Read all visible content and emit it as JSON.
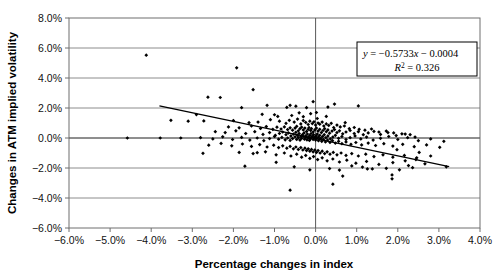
{
  "chart_data": {
    "type": "scatter",
    "title": "",
    "xlabel": "Percentage changes in index",
    "ylabel": "Changes in ATM implied volatility",
    "xlim": [
      -6.0,
      4.0
    ],
    "ylim": [
      -6.0,
      8.0
    ],
    "xtick_labels": [
      "-6.0%",
      "-5.0%",
      "-4.0%",
      "-3.0%",
      "-2.0%",
      "-1.0%",
      "0.0%",
      "1.0%",
      "2.0%",
      "3.0%",
      "4.0%"
    ],
    "xtick_values": [
      -6.0,
      -5.0,
      -4.0,
      -3.0,
      -2.0,
      -1.0,
      0.0,
      1.0,
      2.0,
      3.0,
      4.0
    ],
    "ytick_labels": [
      "-6.0%",
      "-4.0%",
      "-2.0%",
      "0.0%",
      "2.0%",
      "4.0%",
      "6.0%",
      "8.0%"
    ],
    "ytick_values": [
      -6.0,
      -4.0,
      -2.0,
      0.0,
      2.0,
      4.0,
      6.0,
      8.0
    ],
    "grid": "horizontal",
    "legend_position": "none",
    "marker": "diamond",
    "marker_color": "#000000",
    "annotation": {
      "equation": "y = −0.5733x − 0.0004",
      "equation_y": "y",
      "equation_rest": " = −0.5733",
      "equation_x": "x",
      "equation_tail": " − 0.0004",
      "r_squared_label": "R",
      "r_squared_exp": "2",
      "r_squared_value": " = 0.326",
      "box_border_color": "#000000"
    },
    "trendline": {
      "slope": -0.5733,
      "intercept": -0.0004,
      "x_start": -3.8,
      "x_end": 3.25,
      "color": "#000000"
    },
    "points": [
      [
        -4.12,
        5.52
      ],
      [
        -1.92,
        4.68
      ],
      [
        -1.52,
        3.22
      ],
      [
        -2.62,
        2.72
      ],
      [
        -2.32,
        2.7
      ],
      [
        -1.18,
        2.18
      ],
      [
        -1.8,
        2.02
      ],
      [
        -0.62,
        2.18
      ],
      [
        -0.48,
        2.12
      ],
      [
        -0.7,
        2.04
      ],
      [
        -0.22,
        2.02
      ],
      [
        0.3,
        2.06
      ],
      [
        -2.9,
        1.56
      ],
      [
        -1.3,
        1.58
      ],
      [
        -1.0,
        1.55
      ],
      [
        -0.92,
        1.44
      ],
      [
        -0.58,
        1.5
      ],
      [
        -0.4,
        1.68
      ],
      [
        -0.3,
        1.42
      ],
      [
        -0.12,
        1.62
      ],
      [
        0.04,
        1.3
      ],
      [
        0.26,
        1.44
      ],
      [
        0.02,
        1.7
      ],
      [
        0.72,
        1.02
      ],
      [
        -3.52,
        1.18
      ],
      [
        -3.1,
        1.12
      ],
      [
        -2.72,
        1.14
      ],
      [
        -2.0,
        1.16
      ],
      [
        -1.62,
        1.02
      ],
      [
        -1.4,
        1.06
      ],
      [
        -1.1,
        1.22
      ],
      [
        -0.88,
        1.12
      ],
      [
        -0.72,
        0.98
      ],
      [
        -0.64,
        1.18
      ],
      [
        -0.52,
        1.06
      ],
      [
        -0.44,
        1.26
      ],
      [
        -0.36,
        0.94
      ],
      [
        -0.3,
        1.16
      ],
      [
        -0.24,
        1.04
      ],
      [
        -0.18,
        0.9
      ],
      [
        -0.14,
        1.12
      ],
      [
        -0.08,
        0.96
      ],
      [
        -0.04,
        1.08
      ],
      [
        0.0,
        0.86
      ],
      [
        0.06,
        1.0
      ],
      [
        0.1,
        0.92
      ],
      [
        0.16,
        1.06
      ],
      [
        0.2,
        0.8
      ],
      [
        0.26,
        0.94
      ],
      [
        0.32,
        0.84
      ],
      [
        0.38,
        0.98
      ],
      [
        0.44,
        0.7
      ],
      [
        0.52,
        0.86
      ],
      [
        0.6,
        0.74
      ],
      [
        0.7,
        0.8
      ],
      [
        0.82,
        0.62
      ],
      [
        0.94,
        0.7
      ],
      [
        1.06,
        0.58
      ],
      [
        1.2,
        0.52
      ],
      [
        1.36,
        0.6
      ],
      [
        1.54,
        0.4
      ],
      [
        1.72,
        0.46
      ],
      [
        1.9,
        0.34
      ],
      [
        2.1,
        0.28
      ],
      [
        2.3,
        0.22
      ],
      [
        -2.12,
        0.74
      ],
      [
        -1.86,
        0.68
      ],
      [
        -1.56,
        0.8
      ],
      [
        -1.34,
        0.64
      ],
      [
        -1.2,
        0.76
      ],
      [
        -1.04,
        0.58
      ],
      [
        -0.94,
        0.72
      ],
      [
        -0.84,
        0.6
      ],
      [
        -0.76,
        0.74
      ],
      [
        -0.68,
        0.56
      ],
      [
        -0.62,
        0.68
      ],
      [
        -0.56,
        0.52
      ],
      [
        -0.5,
        0.66
      ],
      [
        -0.46,
        0.78
      ],
      [
        -0.42,
        0.48
      ],
      [
        -0.38,
        0.62
      ],
      [
        -0.34,
        0.72
      ],
      [
        -0.3,
        0.54
      ],
      [
        -0.26,
        0.66
      ],
      [
        -0.22,
        0.44
      ],
      [
        -0.18,
        0.58
      ],
      [
        -0.16,
        0.7
      ],
      [
        -0.12,
        0.5
      ],
      [
        -0.1,
        0.62
      ],
      [
        -0.06,
        0.4
      ],
      [
        -0.02,
        0.54
      ],
      [
        0.02,
        0.66
      ],
      [
        0.06,
        0.46
      ],
      [
        0.1,
        0.58
      ],
      [
        0.14,
        0.36
      ],
      [
        0.18,
        0.5
      ],
      [
        0.22,
        0.62
      ],
      [
        0.26,
        0.42
      ],
      [
        0.3,
        0.54
      ],
      [
        0.34,
        0.32
      ],
      [
        0.4,
        0.46
      ],
      [
        0.46,
        0.56
      ],
      [
        0.52,
        0.36
      ],
      [
        0.58,
        0.48
      ],
      [
        0.66,
        0.28
      ],
      [
        0.74,
        0.4
      ],
      [
        0.84,
        0.5
      ],
      [
        0.94,
        0.3
      ],
      [
        1.04,
        0.42
      ],
      [
        1.16,
        0.22
      ],
      [
        1.28,
        0.34
      ],
      [
        1.42,
        0.44
      ],
      [
        1.58,
        0.24
      ],
      [
        1.76,
        0.36
      ],
      [
        1.96,
        0.16
      ],
      [
        2.18,
        0.26
      ],
      [
        2.42,
        0.06
      ],
      [
        -2.44,
        0.42
      ],
      [
        -2.2,
        0.36
      ],
      [
        -1.94,
        0.48
      ],
      [
        -1.7,
        0.3
      ],
      [
        -1.48,
        0.42
      ],
      [
        -1.28,
        0.24
      ],
      [
        -1.12,
        0.36
      ],
      [
        -0.98,
        0.18
      ],
      [
        -0.88,
        0.3
      ],
      [
        -0.8,
        0.4
      ],
      [
        -0.72,
        0.22
      ],
      [
        -0.66,
        0.34
      ],
      [
        -0.6,
        0.14
      ],
      [
        -0.54,
        0.26
      ],
      [
        -0.48,
        0.38
      ],
      [
        -0.44,
        0.18
      ],
      [
        -0.4,
        0.3
      ],
      [
        -0.36,
        0.1
      ],
      [
        -0.32,
        0.22
      ],
      [
        -0.28,
        0.34
      ],
      [
        -0.24,
        0.14
      ],
      [
        -0.2,
        0.26
      ],
      [
        -0.17,
        0.06
      ],
      [
        -0.14,
        0.18
      ],
      [
        -0.11,
        0.3
      ],
      [
        -0.08,
        0.1
      ],
      [
        -0.05,
        0.22
      ],
      [
        -0.02,
        0.02
      ],
      [
        0.01,
        0.14
      ],
      [
        0.04,
        0.26
      ],
      [
        0.07,
        0.06
      ],
      [
        0.1,
        0.18
      ],
      [
        0.13,
        -0.02
      ],
      [
        0.17,
        0.1
      ],
      [
        0.21,
        0.22
      ],
      [
        0.25,
        0.02
      ],
      [
        0.3,
        0.14
      ],
      [
        0.36,
        -0.06
      ],
      [
        0.42,
        0.06
      ],
      [
        0.48,
        0.18
      ],
      [
        0.56,
        -0.02
      ],
      [
        0.64,
        0.1
      ],
      [
        0.74,
        -0.1
      ],
      [
        0.84,
        0.02
      ],
      [
        0.96,
        0.14
      ],
      [
        1.1,
        -0.06
      ],
      [
        1.24,
        0.06
      ],
      [
        1.4,
        -0.14
      ],
      [
        1.58,
        -0.02
      ],
      [
        1.78,
        0.1
      ],
      [
        2.0,
        -0.1
      ],
      [
        2.24,
        0.02
      ],
      [
        2.5,
        -0.18
      ],
      [
        2.8,
        -0.06
      ],
      [
        3.12,
        -0.22
      ],
      [
        -2.8,
        0.02
      ],
      [
        -2.5,
        -0.06
      ],
      [
        -2.26,
        0.08
      ],
      [
        -2.02,
        -0.1
      ],
      [
        -1.8,
        0.04
      ],
      [
        -1.6,
        -0.14
      ],
      [
        -1.42,
        0.0
      ],
      [
        -1.26,
        -0.18
      ],
      [
        -1.12,
        -0.04
      ],
      [
        -1.0,
        0.1
      ],
      [
        -0.9,
        -0.08
      ],
      [
        -0.82,
        0.04
      ],
      [
        -0.74,
        -0.12
      ],
      [
        -0.68,
        0.0
      ],
      [
        -0.62,
        -0.16
      ],
      [
        -0.56,
        -0.04
      ],
      [
        -0.5,
        0.08
      ],
      [
        -0.46,
        -0.1
      ],
      [
        -0.42,
        0.02
      ],
      [
        -0.38,
        -0.14
      ],
      [
        -0.34,
        -0.02
      ],
      [
        -0.3,
        0.1
      ],
      [
        -0.27,
        -0.08
      ],
      [
        -0.24,
        0.04
      ],
      [
        -0.21,
        -0.12
      ],
      [
        -0.18,
        0.0
      ],
      [
        -0.15,
        -0.16
      ],
      [
        -0.12,
        -0.04
      ],
      [
        -0.09,
        0.08
      ],
      [
        -0.06,
        -0.1
      ],
      [
        -0.03,
        0.02
      ],
      [
        0.0,
        -0.14
      ],
      [
        0.03,
        -0.02
      ],
      [
        0.07,
        -0.18
      ],
      [
        0.11,
        -0.06
      ],
      [
        0.15,
        -0.22
      ],
      [
        0.19,
        -0.1
      ],
      [
        0.24,
        -0.26
      ],
      [
        0.29,
        -0.14
      ],
      [
        0.35,
        -0.3
      ],
      [
        0.41,
        -0.18
      ],
      [
        0.48,
        -0.34
      ],
      [
        0.56,
        -0.22
      ],
      [
        0.64,
        -0.38
      ],
      [
        0.74,
        -0.26
      ],
      [
        0.86,
        -0.42
      ],
      [
        0.98,
        -0.3
      ],
      [
        1.12,
        -0.46
      ],
      [
        1.28,
        -0.34
      ],
      [
        1.46,
        -0.5
      ],
      [
        1.66,
        -0.38
      ],
      [
        1.88,
        -0.54
      ],
      [
        2.12,
        -0.42
      ],
      [
        2.4,
        -0.58
      ],
      [
        2.7,
        -0.46
      ],
      [
        3.02,
        -0.62
      ],
      [
        -2.6,
        -0.48
      ],
      [
        -2.3,
        -0.36
      ],
      [
        -2.04,
        -0.52
      ],
      [
        -1.78,
        -0.4
      ],
      [
        -1.56,
        -0.56
      ],
      [
        -1.36,
        -0.44
      ],
      [
        -1.18,
        -0.6
      ],
      [
        -1.02,
        -0.48
      ],
      [
        -0.9,
        -0.64
      ],
      [
        -0.8,
        -0.52
      ],
      [
        -0.7,
        -0.68
      ],
      [
        -0.62,
        -0.56
      ],
      [
        -0.54,
        -0.72
      ],
      [
        -0.48,
        -0.6
      ],
      [
        -0.42,
        -0.76
      ],
      [
        -0.36,
        -0.64
      ],
      [
        -0.31,
        -0.8
      ],
      [
        -0.26,
        -0.68
      ],
      [
        -0.22,
        -0.84
      ],
      [
        -0.18,
        -0.72
      ],
      [
        -0.14,
        -0.88
      ],
      [
        -0.1,
        -0.76
      ],
      [
        -0.06,
        -0.92
      ],
      [
        -0.02,
        -0.8
      ],
      [
        0.02,
        -0.96
      ],
      [
        0.06,
        -0.84
      ],
      [
        0.11,
        -1.0
      ],
      [
        0.16,
        -0.88
      ],
      [
        0.22,
        -1.04
      ],
      [
        0.28,
        -0.92
      ],
      [
        0.35,
        -1.08
      ],
      [
        0.43,
        -0.96
      ],
      [
        0.52,
        -1.12
      ],
      [
        0.62,
        -1.0
      ],
      [
        0.74,
        -1.16
      ],
      [
        0.88,
        -1.04
      ],
      [
        1.04,
        -1.2
      ],
      [
        1.22,
        -1.08
      ],
      [
        1.42,
        -1.24
      ],
      [
        1.64,
        -1.12
      ],
      [
        1.88,
        -1.28
      ],
      [
        2.16,
        -1.16
      ],
      [
        2.46,
        -1.32
      ],
      [
        2.8,
        -1.2
      ],
      [
        3.18,
        -1.92
      ],
      [
        -1.86,
        -0.96
      ],
      [
        -1.52,
        -1.04
      ],
      [
        -1.22,
        -0.92
      ],
      [
        -0.96,
        -1.12
      ],
      [
        -0.76,
        -1.0
      ],
      [
        -0.6,
        -1.2
      ],
      [
        -0.46,
        -1.08
      ],
      [
        -0.34,
        -1.28
      ],
      [
        -0.24,
        -1.16
      ],
      [
        -0.14,
        -1.36
      ],
      [
        -0.05,
        -1.24
      ],
      [
        0.05,
        -1.44
      ],
      [
        0.16,
        -1.32
      ],
      [
        0.28,
        -1.52
      ],
      [
        0.42,
        -1.4
      ],
      [
        0.58,
        -1.6
      ],
      [
        0.76,
        -1.48
      ],
      [
        0.98,
        -1.68
      ],
      [
        1.24,
        -1.56
      ],
      [
        1.54,
        -1.76
      ],
      [
        1.88,
        -1.64
      ],
      [
        2.26,
        -1.84
      ],
      [
        2.66,
        -1.72
      ],
      [
        -1.72,
        -1.88
      ],
      [
        -0.52,
        -1.92
      ],
      [
        0.34,
        -2.04
      ],
      [
        0.58,
        -2.14
      ],
      [
        1.26,
        -2.06
      ],
      [
        1.38,
        -2.06
      ],
      [
        1.72,
        -2.02
      ],
      [
        2.04,
        -2.12
      ],
      [
        2.36,
        -1.98
      ],
      [
        0.66,
        -2.54
      ],
      [
        1.86,
        -2.46
      ],
      [
        1.86,
        -2.72
      ],
      [
        0.42,
        -3.08
      ],
      [
        -0.62,
        -3.48
      ],
      [
        -1.42,
        -0.98
      ],
      [
        -2.74,
        -1.02
      ],
      [
        -3.28,
        0.0
      ],
      [
        -4.58,
        0.0
      ],
      [
        -3.78,
        0.0
      ],
      [
        0.88,
        -1.86
      ],
      [
        1.14,
        -1.94
      ],
      [
        -0.14,
        -2.12
      ],
      [
        -0.96,
        -1.62
      ],
      [
        2.52,
        -0.96
      ],
      [
        2.44,
        -1.44
      ],
      [
        1.98,
        -0.78
      ],
      [
        2.18,
        -1.52
      ],
      [
        -0.06,
        2.42
      ],
      [
        0.46,
        2.26
      ],
      [
        1.04,
        2.14
      ]
    ]
  },
  "plot_style": {
    "frame_color": "#6e6e6e",
    "gridline_color": "#808080",
    "axis_line_color": "#595959",
    "background": "#ffffff"
  }
}
